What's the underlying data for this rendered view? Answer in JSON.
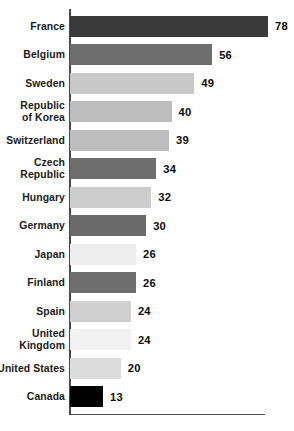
{
  "chart_data": {
    "type": "bar",
    "orientation": "horizontal",
    "title": "",
    "subtitle": "",
    "xlabel": "",
    "ylabel": "",
    "legend": [],
    "grid": false,
    "xlim": [
      0,
      78
    ],
    "categories": [
      "France",
      "Belgium",
      "Sweden",
      "Republic of Korea",
      "Switzerland",
      "Czech Republic",
      "Hungary",
      "Germany",
      "Japan",
      "Finland",
      "Spain",
      "United Kingdom",
      "United States",
      "Canada"
    ],
    "values": [
      78,
      56,
      49,
      40,
      39,
      34,
      32,
      30,
      26,
      26,
      24,
      24,
      20,
      13
    ],
    "bar_colors": [
      "#3a3a3a",
      "#6e6e6e",
      "#c8c8c8",
      "#bdbdbd",
      "#bdbdbd",
      "#6e6e6e",
      "#cdcdcd",
      "#6a6a6a",
      "#ededed",
      "#6e6e6e",
      "#cfcfcf",
      "#f2f2f2",
      "#dcdcdc",
      "#000000"
    ],
    "axis_color": "#4a4a4a",
    "background_color": "#ffffff",
    "label_color": "#1b1b1b"
  },
  "bars": [
    {
      "label_line1": "France",
      "label_line2": "",
      "value": "78",
      "color": "#3a3a3a"
    },
    {
      "label_line1": "Belgium",
      "label_line2": "",
      "value": "56",
      "color": "#6e6e6e"
    },
    {
      "label_line1": "Sweden",
      "label_line2": "",
      "value": "49",
      "color": "#c8c8c8"
    },
    {
      "label_line1": "Republic",
      "label_line2": "of Korea",
      "value": "40",
      "color": "#bdbdbd"
    },
    {
      "label_line1": "Switzerland",
      "label_line2": "",
      "value": "39",
      "color": "#bdbdbd"
    },
    {
      "label_line1": "Czech",
      "label_line2": "Republic",
      "value": "34",
      "color": "#6e6e6e"
    },
    {
      "label_line1": "Hungary",
      "label_line2": "",
      "value": "32",
      "color": "#cdcdcd"
    },
    {
      "label_line1": "Germany",
      "label_line2": "",
      "value": "30",
      "color": "#6a6a6a"
    },
    {
      "label_line1": "Japan",
      "label_line2": "",
      "value": "26",
      "color": "#ededed"
    },
    {
      "label_line1": "Finland",
      "label_line2": "",
      "value": "26",
      "color": "#6e6e6e"
    },
    {
      "label_line1": "Spain",
      "label_line2": "",
      "value": "24",
      "color": "#cfcfcf"
    },
    {
      "label_line1": "United",
      "label_line2": "Kingdom",
      "value": "24",
      "color": "#f2f2f2"
    },
    {
      "label_line1": "United States",
      "label_line2": "",
      "value": "20",
      "color": "#dcdcdc"
    },
    {
      "label_line1": "Canada",
      "label_line2": "",
      "value": "13",
      "color": "#000000"
    }
  ],
  "geometry": {
    "axis_x_px": 69,
    "bar_start_px": 70,
    "px_per_unit": 2.538,
    "row_pitch_px": 28.5,
    "row_top_px": 12,
    "bar_height_px": 21,
    "value_gap_px": 7
  }
}
